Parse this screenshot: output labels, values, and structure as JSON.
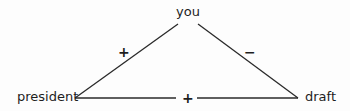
{
  "diagram": {
    "type": "signed-triangle",
    "nodes": [
      {
        "id": "you",
        "label": "you",
        "x": 188,
        "y": 13
      },
      {
        "id": "president",
        "label": "president",
        "x": 42,
        "y": 97
      },
      {
        "id": "draft",
        "label": "draft",
        "x": 318,
        "y": 97
      }
    ],
    "edges": [
      {
        "from": "president",
        "to": "you",
        "sign": "+"
      },
      {
        "from": "you",
        "to": "draft",
        "sign": "−"
      },
      {
        "from": "president",
        "to": "draft",
        "sign": "+"
      }
    ]
  },
  "labels": {
    "you": "you",
    "president": "president",
    "draft": "draft",
    "edge_president_you": "+",
    "edge_you_draft": "−",
    "edge_president_draft": "+"
  },
  "colors": {
    "line": "#2a2a2a",
    "text": "#1e1e1e",
    "background": "#fdfdfd"
  }
}
